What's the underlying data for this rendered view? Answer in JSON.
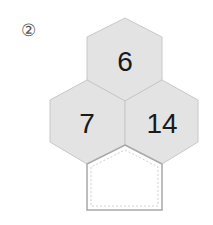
{
  "problem_label": "②",
  "colors": {
    "hex_fill": "#e3e3e3",
    "hex_stroke": "#c8c8c8",
    "pentagon_stroke": "#a8a8a8"
  },
  "cells": {
    "top": "6",
    "left": "7",
    "right": "14",
    "bottom": ""
  }
}
